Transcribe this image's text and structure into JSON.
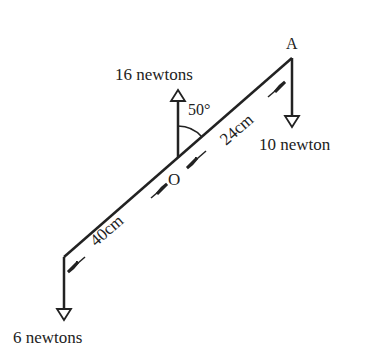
{
  "diagram": {
    "point_a": "A",
    "point_o": "O",
    "angle_label": "50°",
    "force_up_label": "16 newtons",
    "force_right_label": "10 newton",
    "force_left_label": "6 newtons",
    "dist_right": "24cm",
    "dist_left": "40cm",
    "colors": {
      "ink": "#222222",
      "background": "#ffffff"
    }
  }
}
